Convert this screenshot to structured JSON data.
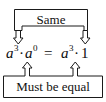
{
  "diagram": {
    "type": "annotated-equation",
    "top_callout": {
      "label": "Same",
      "points_to": [
        "a^0 term on left side",
        "1 term on right side"
      ],
      "arrow_direction": "down",
      "arrow_count": 2
    },
    "equation": {
      "full_text": "a³ · a⁰ = a³ · 1",
      "left_side": {
        "base_1": "a",
        "exponent_1": "3",
        "operator": "·",
        "base_2": "a",
        "exponent_2": "0"
      },
      "relation": "=",
      "right_side": {
        "base_1": "a",
        "exponent_1": "3",
        "operator": "·",
        "value_2": "1"
      }
    },
    "bottom_callout": {
      "label": "Must be equal",
      "points_to": [
        "a³ factor on left side",
        "a³ factor on right side"
      ],
      "arrow_direction": "up",
      "arrow_count": 2
    },
    "colors": {
      "stroke": "#1a1a1a",
      "text": "#0d0d0d",
      "background": "#ffffff"
    }
  }
}
